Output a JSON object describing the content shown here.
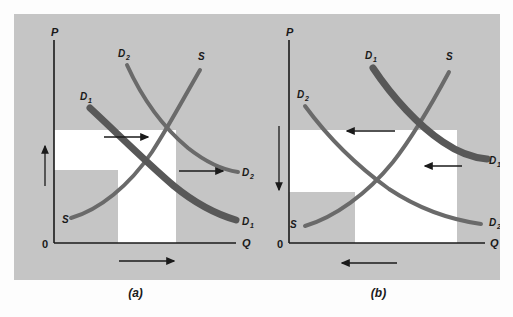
{
  "figure": {
    "background_color": "#fdfdfd",
    "panel_color": "#c5c5c5",
    "highlight_color": "#ffffff",
    "thick_curve_color": "#585858",
    "thin_curve_color": "#6a6a6a",
    "axis_color": "#1a1a1a"
  },
  "panels": [
    {
      "id": "a",
      "caption": "(a)",
      "axes": {
        "y_label": "P",
        "x_label": "Q",
        "origin_label": "0"
      },
      "curves": [
        {
          "name": "supply-curve",
          "label": "S",
          "label_top": "S",
          "label_bottom": "S",
          "style": "thin"
        },
        {
          "name": "demand-curve-initial",
          "label": "D",
          "subscript": "1",
          "style": "thick"
        },
        {
          "name": "demand-curve-shifted",
          "label": "D",
          "subscript": "2",
          "style": "thin"
        }
      ],
      "labels": {
        "demand_initial_top": "D",
        "demand_initial_top_sub": "1",
        "demand_shifted_top": "D",
        "demand_shifted_top_sub": "2",
        "supply_top": "S",
        "supply_bottom": "S",
        "demand_shifted_right": "D",
        "demand_shifted_right_sub": "2",
        "demand_initial_right": "D",
        "demand_initial_right_sub": "1"
      },
      "arrows": {
        "price_direction": "up",
        "quantity_direction": "right",
        "demand_shift_upper": "right",
        "demand_shift_lower": "right"
      }
    },
    {
      "id": "b",
      "caption": "(b)",
      "axes": {
        "y_label": "P",
        "x_label": "Q",
        "origin_label": "0"
      },
      "curves": [
        {
          "name": "supply-curve",
          "label": "S",
          "label_top": "S",
          "label_bottom": "S",
          "style": "thin"
        },
        {
          "name": "demand-curve-initial",
          "label": "D",
          "subscript": "1",
          "style": "thick"
        },
        {
          "name": "demand-curve-shifted",
          "label": "D",
          "subscript": "2",
          "style": "thin"
        }
      ],
      "labels": {
        "demand_initial_top": "D",
        "demand_initial_top_sub": "1",
        "demand_shifted_top": "D",
        "demand_shifted_top_sub": "2",
        "supply_top": "S",
        "supply_bottom": "S",
        "demand_initial_right": "D",
        "demand_initial_right_sub": "1",
        "demand_shifted_right": "D",
        "demand_shifted_right_sub": "2"
      },
      "arrows": {
        "price_direction": "down",
        "quantity_direction": "left",
        "demand_shift_upper": "left",
        "demand_shift_lower": "left"
      }
    }
  ]
}
